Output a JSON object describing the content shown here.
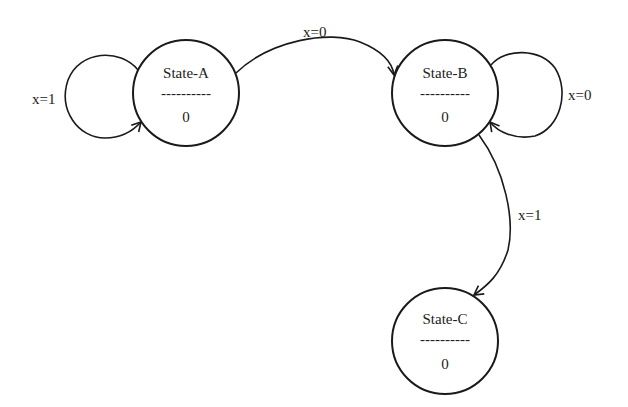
{
  "diagram": {
    "type": "state-machine",
    "states": [
      {
        "id": "A",
        "name": "State-A",
        "divider": "----------",
        "output": "0"
      },
      {
        "id": "B",
        "name": "State-B",
        "divider": "----------",
        "output": "0"
      },
      {
        "id": "C",
        "name": "State-C",
        "divider": "----------",
        "output": "0"
      }
    ],
    "transitions": [
      {
        "from": "A",
        "to": "A",
        "label": "x=1"
      },
      {
        "from": "A",
        "to": "B",
        "label": "x=0"
      },
      {
        "from": "B",
        "to": "B",
        "label": "x=0"
      },
      {
        "from": "B",
        "to": "C",
        "label": "x=1"
      }
    ],
    "colors": {
      "stroke": "#1a1a1a",
      "text": "#222222",
      "background": "#ffffff"
    }
  }
}
